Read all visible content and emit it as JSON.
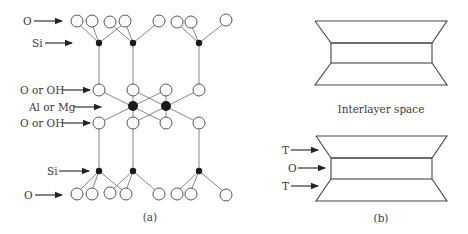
{
  "figure": {
    "panel_a": {
      "caption": "(a)",
      "labels": {
        "top_o": "O",
        "top_si": "Si",
        "oct_top": "O or OH",
        "oct_metal": "Al or Mg",
        "oct_bottom": "O or OH",
        "bottom_si": "Si",
        "bottom_o": "O"
      }
    },
    "panel_b": {
      "caption": "(b)",
      "interlayer_label": "Interlayer space",
      "layer_labels": [
        "T",
        "O",
        "T"
      ]
    },
    "colors": {
      "line": "#444444",
      "filled_atom": "#1a1a1a",
      "text": "#3a3a3a",
      "background": "#ffffff"
    }
  }
}
